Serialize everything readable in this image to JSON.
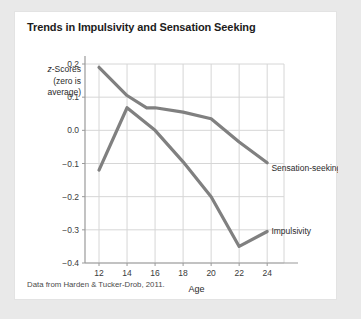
{
  "card": {
    "title": "Trends in Impulsivity and Sensation Seeking",
    "source_note": "Data from Harden & Tucker-Drob, 2011.",
    "background_color": "#ffffff",
    "page_background_color": "#e9e9e9"
  },
  "axis_label_block": {
    "line1_italic": "z",
    "line1_rest": "-Scores",
    "line2": "(zero is",
    "line3": "average)"
  },
  "chart_data": {
    "type": "line",
    "title": "Trends in Impulsivity and Sensation Seeking",
    "subtitle": "",
    "xlabel": "Age",
    "ylabel": "z-Scores (zero is average)",
    "x": [
      12,
      14,
      16,
      18,
      20,
      22,
      24
    ],
    "xticks": [
      "12",
      "14",
      "16",
      "18",
      "20",
      "22",
      "24"
    ],
    "yticks": [
      "0.2",
      "0.1",
      "0.0",
      "-0.1",
      "-0.2",
      "-0.3",
      "-0.4"
    ],
    "ytick_values": [
      0.2,
      0.1,
      0.0,
      -0.1,
      -0.2,
      -0.3,
      -0.4
    ],
    "xlim": [
      11,
      25.2
    ],
    "ylim": [
      -0.4,
      0.2
    ],
    "grid": true,
    "legend": "inline-labels",
    "line_color": "#808080",
    "grid_color": "#d6d6d6",
    "axis_color": "#9a9a9a",
    "series": [
      {
        "name": "Sensation-seeking",
        "label": "Sensation-seeking",
        "label_x": 24.3,
        "label_y": -0.115,
        "values": [
          0.19,
          0.1,
          0.045,
          0.0,
          -0.035,
          -0.07,
          -0.1
        ]
      },
      {
        "name": "Impulsivity",
        "label": "Impulsivity",
        "label_x": 24.3,
        "label_y": -0.305,
        "values": [
          -0.12,
          0.065,
          0.07,
          0.06,
          0.04,
          -0.005,
          -0.04
        ]
      }
    ],
    "series_plotted": [
      {
        "name": "Sensation-seeking",
        "points": [
          [
            12,
            0.19
          ],
          [
            14,
            0.105
          ],
          [
            15.4,
            0.068
          ],
          [
            16,
            0.068
          ],
          [
            18,
            0.055
          ],
          [
            20,
            0.035
          ],
          [
            22,
            -0.035
          ],
          [
            24,
            -0.098
          ]
        ]
      },
      {
        "name": "Impulsivity",
        "points": [
          [
            12,
            -0.12
          ],
          [
            14,
            0.068
          ],
          [
            16,
            0.0
          ],
          [
            18,
            -0.095
          ],
          [
            20,
            -0.2
          ],
          [
            22,
            -0.35
          ],
          [
            24,
            -0.305
          ]
        ]
      }
    ]
  }
}
